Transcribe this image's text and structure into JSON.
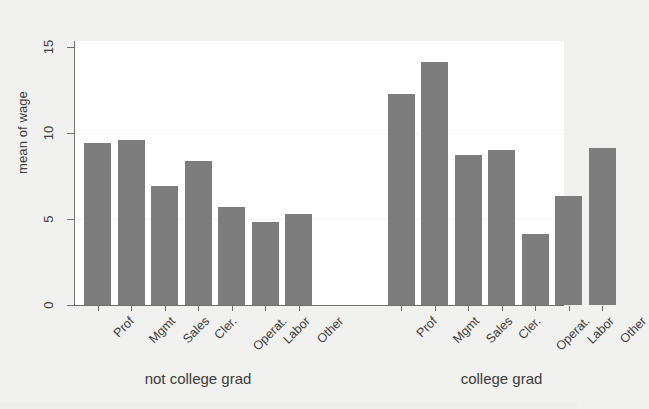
{
  "chart_data": {
    "type": "bar",
    "title": "",
    "subtitle": "",
    "xlabel": "",
    "ylabel": "mean of wage",
    "ylim": [
      0,
      15
    ],
    "yticks": [
      0,
      5,
      10,
      15
    ],
    "ytick_labels": [
      "0",
      "5",
      "10",
      "15"
    ],
    "grid": false,
    "legend": "none",
    "categories": [
      "Prof",
      "Mgmt",
      "Sales",
      "Cler.",
      "Operat.",
      "Labor",
      "Other"
    ],
    "groups": [
      {
        "label": "not college grad",
        "values": [
          9.4,
          9.6,
          6.9,
          8.4,
          5.7,
          4.85,
          5.3
        ]
      },
      {
        "label": "college grad",
        "values": [
          12.25,
          14.15,
          8.7,
          9.0,
          4.1,
          6.35,
          9.1
        ]
      }
    ],
    "bar_color": "#7d7d7d",
    "plot_background": "#ffffff",
    "figure_background": "#f1f1ef",
    "axis_color": "#6f6f6f"
  },
  "axis": {
    "y_title": "mean of wage",
    "ticks": [
      {
        "label": "15",
        "value": 15
      },
      {
        "label": "10",
        "value": 10
      },
      {
        "label": "5",
        "value": 5
      },
      {
        "label": "0",
        "value": 0
      }
    ]
  },
  "groups": [
    {
      "name": "not-college-grad",
      "label": "not college grad",
      "bars": [
        {
          "category": "Prof",
          "value": 9.4
        },
        {
          "category": "Mgmt",
          "value": 9.6
        },
        {
          "category": "Sales",
          "value": 6.9
        },
        {
          "category": "Cler.",
          "value": 8.4
        },
        {
          "category": "Operat.",
          "value": 5.7
        },
        {
          "category": "Labor",
          "value": 4.85
        },
        {
          "category": "Other",
          "value": 5.3
        }
      ]
    },
    {
      "name": "college-grad",
      "label": "college grad",
      "bars": [
        {
          "category": "Prof",
          "value": 12.25
        },
        {
          "category": "Mgmt",
          "value": 14.15
        },
        {
          "category": "Sales",
          "value": 8.7
        },
        {
          "category": "Cler.",
          "value": 9.0
        },
        {
          "category": "Operat.",
          "value": 4.1
        },
        {
          "category": "Labor",
          "value": 6.35
        },
        {
          "category": "Other",
          "value": 9.1
        }
      ]
    }
  ]
}
